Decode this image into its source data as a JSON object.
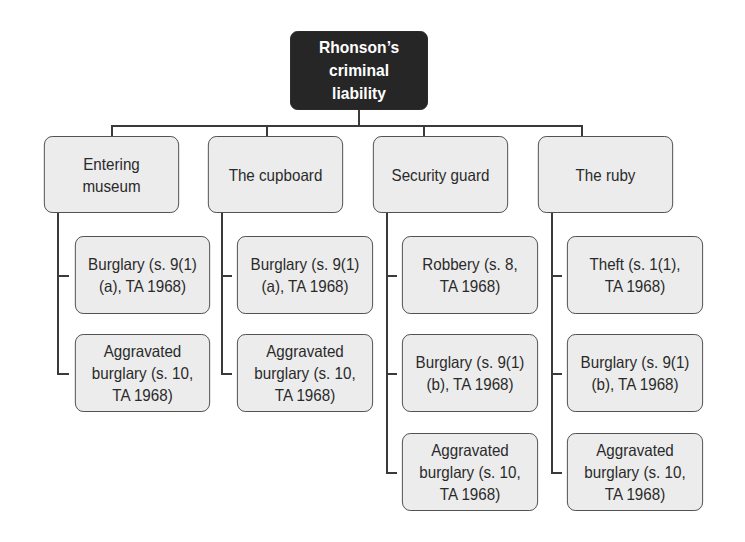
{
  "root": {
    "label": "Rhonson’s criminal liability"
  },
  "columns": [
    {
      "label": "Entering museum",
      "children": [
        {
          "label": "Burglary (s. 9(1)(a), TA 1968)"
        },
        {
          "label": "Aggravated burglary (s. 10, TA 1968)"
        }
      ]
    },
    {
      "label": "The cupboard",
      "children": [
        {
          "label": "Burglary (s. 9(1)(a), TA 1968)"
        },
        {
          "label": "Aggravated burglary (s. 10, TA 1968)"
        }
      ]
    },
    {
      "label": "Security guard",
      "children": [
        {
          "label": "Robbery (s. 8, TA 1968)"
        },
        {
          "label": "Burglary (s. 9(1)(b), TA 1968)"
        },
        {
          "label": "Aggravated burglary (s. 10, TA 1968)"
        }
      ]
    },
    {
      "label": "The ruby",
      "children": [
        {
          "label": "Theft (s. 1(1), TA 1968)"
        },
        {
          "label": "Burglary (s. 9(1)(b), TA 1968)"
        },
        {
          "label": "Aggravated burglary (s. 10, TA 1968)"
        }
      ]
    }
  ],
  "colors": {
    "root_fill": "#262626",
    "root_text": "#ffffff",
    "node_fill": "#ececec",
    "node_border": "#4a4a4a",
    "connector": "#3a3a3a"
  }
}
